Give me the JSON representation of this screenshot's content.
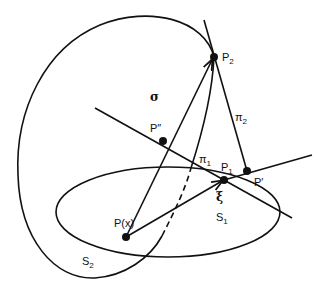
{
  "diagram": {
    "stroke_color": "#111111",
    "background": "#ffffff",
    "points": {
      "P_x": {
        "label": "P",
        "suffix": "(x)",
        "x": 126,
        "y": 237
      },
      "P1": {
        "label": "P",
        "sub": "1",
        "x": 224,
        "y": 180
      },
      "P2": {
        "label": "P",
        "sub": "2",
        "x": 214,
        "y": 57
      },
      "P_prime": {
        "label": "P′",
        "x": 247,
        "y": 171
      },
      "P_dprime": {
        "label": "P″",
        "x": 163,
        "y": 141
      }
    },
    "labels": {
      "sigma": "σ",
      "xi": "ξ",
      "pi1": "π",
      "pi1_sub": "1",
      "pi2": "π",
      "pi2_sub": "2",
      "S1": "S",
      "S1_sub": "1",
      "S2": "S",
      "S2_sub": "2",
      "P": "P",
      "sub1": "1",
      "sub2": "2",
      "Px_suffix": "(x)",
      "P_prime": "P′",
      "P_dprime": "P″"
    }
  }
}
